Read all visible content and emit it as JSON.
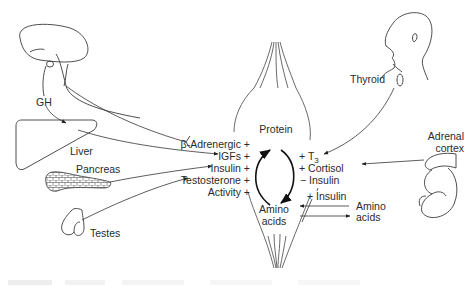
{
  "diagram": {
    "type": "physiology-regulation",
    "topic": "Hormonal regulation of protein synthesis and breakdown",
    "organs": {
      "pituitary": {
        "label": ""
      },
      "liver": {
        "label": "Liver"
      },
      "pancreas": {
        "label": "Pancreas"
      },
      "testes": {
        "label": "Testes"
      },
      "thyroid": {
        "label": "Thyroid"
      },
      "adrenal": {
        "label_line1": "Adrenal",
        "label_line2": "cortex"
      }
    },
    "signals": {
      "gh": "GH"
    },
    "center": {
      "protein": "Protein",
      "amino_acids_line1": "Amino",
      "amino_acids_line2": "acids"
    },
    "anabolic_factors": [
      {
        "name": "β-Adrenergic",
        "sign": "+"
      },
      {
        "name": "IGFs",
        "sign": "+"
      },
      {
        "name": "Insulin",
        "sign": "+"
      },
      {
        "name": "Testosterone",
        "sign": "+"
      },
      {
        "name": "Activity",
        "sign": "+"
      }
    ],
    "catabolic_factors": [
      {
        "sign": "+",
        "name": "T",
        "subscript": "3"
      },
      {
        "sign": "+",
        "name": "Cortisol",
        "subscript": ""
      },
      {
        "sign": "−",
        "name": "Insulin",
        "subscript": ""
      }
    ],
    "transport": {
      "modifier_sign": "+",
      "modifier_name": "Insulin",
      "external_line1": "Amino",
      "external_line2": "acids"
    },
    "edges": [
      {
        "from": "pituitary",
        "to": "liver",
        "label": "GH"
      },
      {
        "from": "pituitary",
        "to": "β-Adrenergic",
        "style": "inhibit-bar"
      },
      {
        "from": "liver",
        "to": "IGFs"
      },
      {
        "from": "pancreas",
        "to": "Insulin"
      },
      {
        "from": "testes",
        "to": "Testosterone"
      },
      {
        "from": "thyroid",
        "to": "T3"
      },
      {
        "from": "adrenal",
        "to": "Cortisol"
      },
      {
        "from": "amino_acids_external",
        "to": "amino_acids"
      },
      {
        "from": "amino_acids",
        "to": "amino_acids_external"
      }
    ],
    "colors": {
      "line": "#3a3a3a",
      "text": "#2a2a2a",
      "background": "#ffffff"
    }
  }
}
